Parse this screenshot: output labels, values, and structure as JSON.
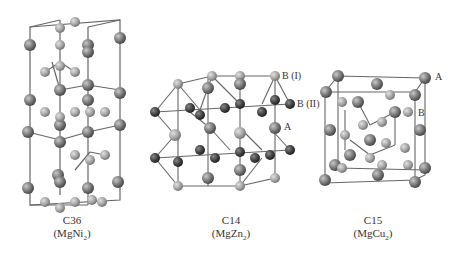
{
  "figure": {
    "structures": [
      {
        "name": "C36",
        "formula_prefix": "(MgNi",
        "formula_sub": "2",
        "formula_suffix": ")"
      },
      {
        "name": "C14",
        "formula_prefix": "(MgZn",
        "formula_sub": "2",
        "formula_suffix": ")"
      },
      {
        "name": "C15",
        "formula_prefix": "(MgCu",
        "formula_sub": "2",
        "formula_suffix": ")"
      }
    ],
    "site_labels": {
      "c14_b1": "B (I)",
      "c14_b2": "B (II)",
      "c14_a": "A",
      "c15_a": "A",
      "c15_b": "B"
    },
    "colors": {
      "atom_a": "#7a7a7a",
      "atom_b_light": "#a8a8a8",
      "atom_b_dark": "#444444",
      "bond": "#666666"
    }
  }
}
